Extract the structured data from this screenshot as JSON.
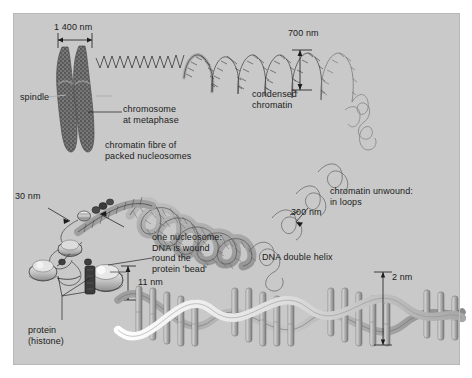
{
  "figure": {
    "background_color": "#c9c9c9",
    "page_color": "#ffffff",
    "ink_color": "#1b1b1b"
  },
  "labels": {
    "scale_1400": "1 400 nm",
    "spindle": "spindle",
    "chromosome_metaphase": "chromosome\nat metaphase",
    "chromatin_fibre": "chromatin fibre of\npacked nucleosomes",
    "scale_700": "700 nm",
    "condensed_chromatin": "condensed\nchromatin",
    "chromatin_unwound": "chromatin unwound:\nin loops",
    "scale_300": "300 nm",
    "scale_30": "30 nm",
    "nucleosome": "one nucleosome:\nDNA is wound\nround the\nprotein 'bead'",
    "scale_11": "11 nm",
    "protein_histone": "protein\n(histone)",
    "dna_double_helix": "DNA double helix",
    "scale_2": "2 nm"
  },
  "structures": {
    "chromosome": {
      "name": "metaphase-chromosome",
      "width_nm": 1400,
      "fill": "#6f6f6f"
    },
    "condensed_chromatin": {
      "name": "condensed-chromatin-solenoid",
      "width_nm": 700
    },
    "chromatin_loops": {
      "name": "chromatin-loops",
      "width_nm": 300
    },
    "fibre_30nm": {
      "name": "chromatin-fibre",
      "width_nm": 30
    },
    "nucleosome": {
      "name": "nucleosome-bead",
      "width_nm": 11
    },
    "dna_helix": {
      "name": "dna-double-helix",
      "width_nm": 2
    }
  },
  "colors": {
    "panel_bg": "#c9c9c9",
    "dark_stroke": "#2a2a2a",
    "mid_grey": "#8f8f8f",
    "light_grey": "#e2e2e2",
    "chromosome_grey": "#6a6a6a",
    "helix_ribbon": "#efefef",
    "helix_ribbon_dark": "#9a9a9a"
  }
}
